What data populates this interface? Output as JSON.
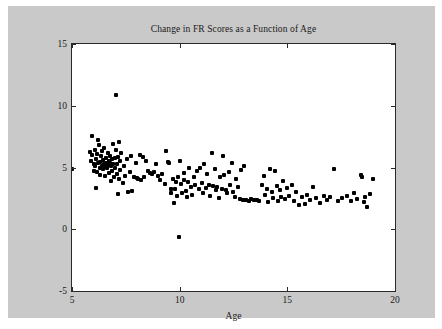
{
  "chart_data": {
    "type": "scatter",
    "title": "Change in FR Scores as a Function of Age",
    "xlabel": "Age",
    "ylabel": "FR Change",
    "xlim": [
      5,
      20
    ],
    "ylim": [
      -5,
      15
    ],
    "xticks": [
      5,
      10,
      15,
      20
    ],
    "yticks": [
      -5,
      0,
      5,
      10,
      15
    ],
    "grid": false,
    "legend": null,
    "marker": {
      "shape": "square",
      "color": "#000000",
      "size": 4
    },
    "series": [
      {
        "name": "FR Change vs Age",
        "points": [
          [
            5.02,
            4.9
          ],
          [
            5.83,
            6.25
          ],
          [
            5.86,
            5.55
          ],
          [
            5.92,
            7.55
          ],
          [
            5.95,
            6.05
          ],
          [
            6.0,
            5.25
          ],
          [
            6.02,
            4.75
          ],
          [
            6.05,
            6.45
          ],
          [
            6.08,
            5.1
          ],
          [
            6.1,
            3.35
          ],
          [
            6.12,
            5.7
          ],
          [
            6.15,
            6.1
          ],
          [
            6.18,
            4.6
          ],
          [
            6.2,
            7.2
          ],
          [
            6.22,
            5.35
          ],
          [
            6.25,
            6.8
          ],
          [
            6.28,
            5.0
          ],
          [
            6.3,
            5.45
          ],
          [
            6.32,
            4.4
          ],
          [
            6.35,
            5.9
          ],
          [
            6.38,
            6.3
          ],
          [
            6.4,
            5.15
          ],
          [
            6.42,
            4.85
          ],
          [
            6.45,
            5.6
          ],
          [
            6.48,
            5.25
          ],
          [
            6.5,
            6.6
          ],
          [
            6.52,
            4.3
          ],
          [
            6.55,
            5.05
          ],
          [
            6.58,
            5.8
          ],
          [
            6.6,
            5.4
          ],
          [
            6.62,
            4.95
          ],
          [
            6.65,
            5.2
          ],
          [
            6.68,
            6.15
          ],
          [
            6.7,
            5.5
          ],
          [
            6.72,
            4.55
          ],
          [
            6.75,
            5.35
          ],
          [
            6.78,
            5.95
          ],
          [
            6.8,
            5.1
          ],
          [
            6.82,
            3.9
          ],
          [
            6.85,
            4.7
          ],
          [
            6.88,
            5.65
          ],
          [
            6.9,
            5.25
          ],
          [
            6.92,
            6.9
          ],
          [
            6.95,
            4.2
          ],
          [
            6.98,
            5.75
          ],
          [
            7.0,
            5.0
          ],
          [
            7.02,
            10.85
          ],
          [
            7.05,
            6.4
          ],
          [
            7.08,
            4.45
          ],
          [
            7.1,
            5.3
          ],
          [
            7.12,
            2.85
          ],
          [
            7.15,
            5.85
          ],
          [
            7.18,
            4.1
          ],
          [
            7.2,
            7.05
          ],
          [
            7.22,
            5.55
          ],
          [
            7.25,
            4.8
          ],
          [
            7.28,
            6.2
          ],
          [
            7.35,
            3.75
          ],
          [
            7.42,
            5.15
          ],
          [
            7.48,
            4.35
          ],
          [
            7.55,
            5.7
          ],
          [
            7.62,
            3.05
          ],
          [
            7.68,
            4.6
          ],
          [
            7.75,
            5.95
          ],
          [
            7.8,
            3.1
          ],
          [
            7.88,
            4.25
          ],
          [
            7.95,
            5.4
          ],
          [
            8.02,
            4.15
          ],
          [
            8.08,
            4.05
          ],
          [
            8.15,
            6.05
          ],
          [
            8.22,
            4.0
          ],
          [
            8.28,
            5.85
          ],
          [
            8.35,
            4.2
          ],
          [
            8.45,
            5.55
          ],
          [
            8.55,
            4.75
          ],
          [
            8.62,
            4.55
          ],
          [
            8.7,
            4.5
          ],
          [
            8.8,
            4.65
          ],
          [
            8.9,
            5.3
          ],
          [
            9.0,
            4.3
          ],
          [
            9.1,
            3.95
          ],
          [
            9.2,
            4.45
          ],
          [
            9.3,
            3.7
          ],
          [
            9.38,
            6.35
          ],
          [
            9.45,
            5.45
          ],
          [
            9.52,
            5.4
          ],
          [
            9.58,
            3.25
          ],
          [
            9.62,
            2.95
          ],
          [
            9.68,
            4.1
          ],
          [
            9.72,
            2.15
          ],
          [
            9.78,
            3.3
          ],
          [
            9.82,
            3.85
          ],
          [
            9.88,
            2.7
          ],
          [
            9.92,
            4.25
          ],
          [
            9.95,
            -0.6
          ],
          [
            10.02,
            5.5
          ],
          [
            10.08,
            3.65
          ],
          [
            10.12,
            2.9
          ],
          [
            10.18,
            3.95
          ],
          [
            10.22,
            4.55
          ],
          [
            10.28,
            3.1
          ],
          [
            10.32,
            2.6
          ],
          [
            10.38,
            3.8
          ],
          [
            10.45,
            5.0
          ],
          [
            10.52,
            3.4
          ],
          [
            10.58,
            2.8
          ],
          [
            10.65,
            4.2
          ],
          [
            10.72,
            3.55
          ],
          [
            10.8,
            4.7
          ],
          [
            10.88,
            3.25
          ],
          [
            10.95,
            4.95
          ],
          [
            11.02,
            3.75
          ],
          [
            11.08,
            2.95
          ],
          [
            11.15,
            5.25
          ],
          [
            11.22,
            3.35
          ],
          [
            11.28,
            4.45
          ],
          [
            11.35,
            3.6
          ],
          [
            11.42,
            2.7
          ],
          [
            11.48,
            6.15
          ],
          [
            11.55,
            3.5
          ],
          [
            11.62,
            4.85
          ],
          [
            11.68,
            3.15
          ],
          [
            11.75,
            3.45
          ],
          [
            11.82,
            2.55
          ],
          [
            11.88,
            4.25
          ],
          [
            11.95,
            3.3
          ],
          [
            12.02,
            5.95
          ],
          [
            12.08,
            4.4
          ],
          [
            12.15,
            3.2
          ],
          [
            12.22,
            2.9
          ],
          [
            12.28,
            4.6
          ],
          [
            12.35,
            3.55
          ],
          [
            12.42,
            5.35
          ],
          [
            12.48,
            3.05
          ],
          [
            12.55,
            2.65
          ],
          [
            12.62,
            4.05
          ],
          [
            12.7,
            3.4
          ],
          [
            12.78,
            2.45
          ],
          [
            12.85,
            4.8
          ],
          [
            12.92,
            2.35
          ],
          [
            13.0,
            5.15
          ],
          [
            13.1,
            2.4
          ],
          [
            13.2,
            2.3
          ],
          [
            13.32,
            2.45
          ],
          [
            13.45,
            2.35
          ],
          [
            13.58,
            2.4
          ],
          [
            13.7,
            2.3
          ],
          [
            13.82,
            3.6
          ],
          [
            13.9,
            4.35
          ],
          [
            13.98,
            2.75
          ],
          [
            14.05,
            3.3
          ],
          [
            14.12,
            2.2
          ],
          [
            14.2,
            4.85
          ],
          [
            14.28,
            3.05
          ],
          [
            14.35,
            2.55
          ],
          [
            14.42,
            4.7
          ],
          [
            14.5,
            3.5
          ],
          [
            14.58,
            2.3
          ],
          [
            14.65,
            3.15
          ],
          [
            14.72,
            2.65
          ],
          [
            14.8,
            3.9
          ],
          [
            14.9,
            2.45
          ],
          [
            15.0,
            3.35
          ],
          [
            15.1,
            2.7
          ],
          [
            15.2,
            3.55
          ],
          [
            15.3,
            2.25
          ],
          [
            15.42,
            3.0
          ],
          [
            15.55,
            1.95
          ],
          [
            15.68,
            2.6
          ],
          [
            15.8,
            2.05
          ],
          [
            15.92,
            2.8
          ],
          [
            16.05,
            2.35
          ],
          [
            16.2,
            3.45
          ],
          [
            16.35,
            2.5
          ],
          [
            16.5,
            2.15
          ],
          [
            16.68,
            2.7
          ],
          [
            16.85,
            2.4
          ],
          [
            17.0,
            2.6
          ],
          [
            17.18,
            4.85
          ],
          [
            17.35,
            2.25
          ],
          [
            17.55,
            2.55
          ],
          [
            17.75,
            2.7
          ],
          [
            17.95,
            2.3
          ],
          [
            18.1,
            2.95
          ],
          [
            18.25,
            2.45
          ],
          [
            18.4,
            4.4
          ],
          [
            18.48,
            4.25
          ],
          [
            18.55,
            2.2
          ],
          [
            18.62,
            2.65
          ],
          [
            18.7,
            1.8
          ],
          [
            18.82,
            2.85
          ],
          [
            19.0,
            4.05
          ]
        ]
      }
    ]
  }
}
